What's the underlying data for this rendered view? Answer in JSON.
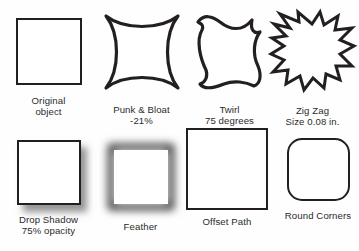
{
  "figure": {
    "background_color": "#fefefe",
    "stroke_color": "#231f20",
    "text_color": "#2b2b2b",
    "rows": [
      {
        "items": [
          {
            "id": "original",
            "shape": "square",
            "label_line1": "Original",
            "label_line2": "object"
          },
          {
            "id": "punk-bloat",
            "shape": "concave-square",
            "label_line1": "Punk & Bloat",
            "label_line2": "-21%"
          },
          {
            "id": "twirl",
            "shape": "twirled-square",
            "label_line1": "Twirl",
            "label_line2": "75 degrees"
          },
          {
            "id": "zig-zag",
            "shape": "zigzag-starburst",
            "label_line1": "Zig Zag",
            "label_line2": "Size 0.08 in."
          }
        ]
      },
      {
        "items": [
          {
            "id": "drop-shadow",
            "shape": "square-with-shadow",
            "label_line1": "Drop Shadow",
            "label_line2": "75% opacity"
          },
          {
            "id": "feather",
            "shape": "square-feathered",
            "label_line1": "Feather",
            "label_line2": ""
          },
          {
            "id": "offset-path",
            "shape": "square-enlarged",
            "label_line1": "Offset Path",
            "label_line2": ""
          },
          {
            "id": "round-corners",
            "shape": "rounded-square",
            "label_line1": "Round Corners",
            "label_line2": ""
          }
        ]
      }
    ]
  }
}
